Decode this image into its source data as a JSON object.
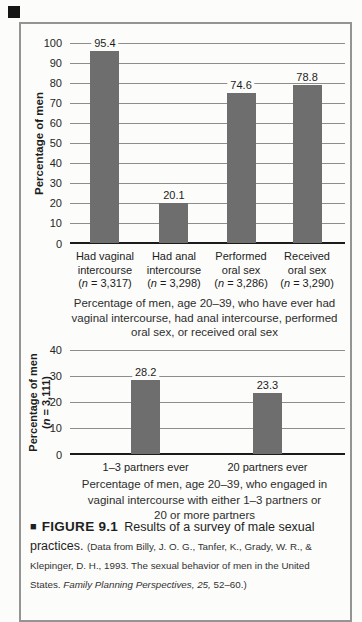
{
  "colors": {
    "background": "#fcfcfa",
    "border": "#949494",
    "bar": "#6e6e6e",
    "grid": "#8d8d8d",
    "axis": "#1b1b1b"
  },
  "chart_data": [
    {
      "type": "bar",
      "title": "",
      "xlabel": "",
      "ylabel": "Percentage of men",
      "ylim": [
        0,
        100
      ],
      "yticks": [
        0,
        10,
        20,
        30,
        40,
        50,
        60,
        70,
        80,
        90,
        100
      ],
      "grid": true,
      "legend": "none",
      "bars": [
        {
          "label_lines": [
            "Had vaginal",
            "intercourse"
          ],
          "n": "3,317",
          "value": 95.4
        },
        {
          "label_lines": [
            "Had anal",
            "intercourse"
          ],
          "n": "3,298",
          "value": 20.1
        },
        {
          "label_lines": [
            "Performed",
            "oral sex"
          ],
          "n": "3,286",
          "value": 74.6
        },
        {
          "label_lines": [
            "Received",
            "oral sex"
          ],
          "n": "3,290",
          "value": 78.8
        }
      ],
      "caption_lines": [
        "Percentage of men, age 20–39, who have ever had",
        "vaginal intercourse, had anal intercourse, performed",
        "oral sex, or received oral sex"
      ]
    },
    {
      "type": "bar",
      "title": "",
      "xlabel": "",
      "ylabel": "Percentage of men",
      "ylabel_n": "3,111",
      "ylim": [
        0,
        40
      ],
      "yticks": [
        0,
        10,
        20,
        30,
        40
      ],
      "grid": true,
      "legend": "none",
      "bars": [
        {
          "label_lines": [
            "1–3 partners ever"
          ],
          "value": 28.2
        },
        {
          "label_lines": [
            "20 partners ever"
          ],
          "value": 23.3
        }
      ],
      "caption_lines": [
        "Percentage of men, age 20–39, who engaged in",
        "vaginal intercourse with either 1–3 partners or",
        "20 or more partners"
      ]
    }
  ],
  "figure_caption": {
    "bullet": "■",
    "label": "FIGURE 9.1",
    "summary": "Results of a survey of male sexual practices.",
    "citation_plain": "(Data from Billy, J. O. G., Tanfer, K., Grady, W. R., & Klepinger, D. H., 1993. The sexual behavior of men in the United States. ",
    "citation_italic": "Family Planning Perspectives, 25,",
    "citation_end": " 52–60.)"
  }
}
